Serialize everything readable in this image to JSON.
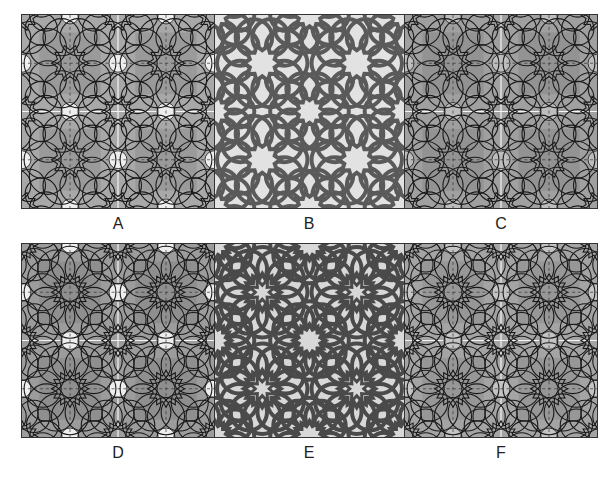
{
  "figure": {
    "rows": [
      {
        "panels": [
          {
            "id": "A",
            "label": "A",
            "style": "outline-dashed",
            "bg": "#a8a8a8",
            "line": "#1a1a1a",
            "highlight": "#eeeeee",
            "x": 21,
            "y": 14,
            "w": 193,
            "h": 194
          },
          {
            "id": "B",
            "label": "B",
            "style": "interlace",
            "bg": "#e2e2e2",
            "line": "#5a5a5a",
            "highlight": "#e2e2e2",
            "x": 214,
            "y": 14,
            "w": 190,
            "h": 194
          },
          {
            "id": "C",
            "label": "C",
            "style": "outline-dashed",
            "bg": "#a0a0a0",
            "line": "#1a1a1a",
            "highlight": "#bdbdbd",
            "x": 404,
            "y": 14,
            "w": 193,
            "h": 194
          }
        ]
      },
      {
        "panels": [
          {
            "id": "D",
            "label": "D",
            "style": "outline-dashed",
            "bg": "#9c9c9c",
            "line": "#1a1a1a",
            "highlight": "#eeeeee",
            "x": 21,
            "y": 243,
            "w": 193,
            "h": 194
          },
          {
            "id": "E",
            "label": "E",
            "style": "interlace",
            "bg": "#d8d8d8",
            "line": "#4a4a4a",
            "highlight": "#d8d8d8",
            "x": 214,
            "y": 243,
            "w": 190,
            "h": 194
          },
          {
            "id": "F",
            "label": "F",
            "style": "outline-dashed",
            "bg": "#a4a4a4",
            "line": "#1a1a1a",
            "highlight": "#c4c4c4",
            "x": 404,
            "y": 243,
            "w": 193,
            "h": 194
          }
        ]
      }
    ],
    "labels": [
      {
        "text": "A",
        "x": 118,
        "y": 215
      },
      {
        "text": "B",
        "x": 309,
        "y": 215
      },
      {
        "text": "C",
        "x": 501,
        "y": 215
      },
      {
        "text": "D",
        "x": 118,
        "y": 444
      },
      {
        "text": "E",
        "x": 309,
        "y": 444
      },
      {
        "text": "F",
        "x": 501,
        "y": 444
      }
    ]
  }
}
